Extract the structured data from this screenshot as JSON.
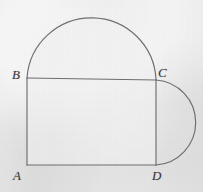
{
  "figure": {
    "background_color": "#e9e9e9",
    "interior_color": "#f1f1f1",
    "stroke_color": "#6e6e6e",
    "label_color": "#3a3a3a",
    "stroke_width": 1.1,
    "canvas": {
      "width": 203,
      "height": 192
    }
  },
  "labels": {
    "a": "A",
    "b": "B",
    "c": "C",
    "d": "D"
  },
  "geometry": {
    "points": {
      "A": {
        "x": 27,
        "y": 165
      },
      "B": {
        "x": 27,
        "y": 78
      },
      "C": {
        "x": 156,
        "y": 80
      },
      "D": {
        "x": 156,
        "y": 165
      }
    },
    "rectangle": {
      "name": "ABCD",
      "sides": [
        "AB",
        "BC",
        "CD",
        "DA"
      ],
      "width": 129,
      "height": 87
    },
    "semicircles": [
      {
        "name": "semicircle-on-BC",
        "diameter_endpoints": [
          "B",
          "C"
        ],
        "center": {
          "x": 91.5,
          "y": 79
        },
        "radius": 64.5,
        "bulge_direction": "up",
        "apex": {
          "x": 91.5,
          "y": 13
        }
      },
      {
        "name": "semicircle-on-CD",
        "diameter_endpoints": [
          "C",
          "D"
        ],
        "center": {
          "x": 156,
          "y": 122.5
        },
        "radius": 42.5,
        "bulge_direction": "right",
        "apex": {
          "x": 197,
          "y": 122.5
        }
      }
    ]
  },
  "paths": {
    "outline": "M 27 165 L 27 78 A 64.5 64.5 0 0 1 156 80 L 156 165 Z",
    "top_arc": "M 27 78 A 64.6 64.6 0 0 1 156 80",
    "right_arc": "M 156 80 A 42.6 42.6 0 0 1 156 165",
    "segment_BC": "M 27 78 L 156 80",
    "segment_AD": "M 27 165 L 156 165",
    "segment_AB": "M 27 165 L 27 78",
    "segment_CD": "M 156 80 L 156 165"
  }
}
